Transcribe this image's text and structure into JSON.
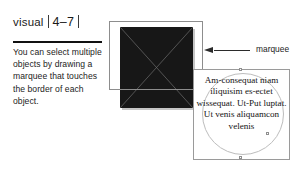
{
  "figure": {
    "label": "visual",
    "number": "4–7",
    "caption": "You can select multiple objects by drawing a marquee that touches the border of each object."
  },
  "artboard": {
    "shapes": [
      {
        "name": "filled-square",
        "fill": "#171717",
        "decoration": "diagonal-cross"
      },
      {
        "name": "text-frame-ellipse",
        "stroke": "#bdbdbd"
      }
    ],
    "marquee": {
      "stroke": "#8d8d8d",
      "label": "marquee"
    },
    "frame_text": "Am-consequat niam iliquisim es-ectet wissequat. Ut-Put luptat. Ut venis aliquamcon velenis"
  },
  "colors": {
    "ink": "#1a1a1a",
    "rule": "#111111",
    "shape_fill": "#171717",
    "marquee_stroke": "#8d8d8d",
    "frame_stroke": "#9a9a9a"
  }
}
